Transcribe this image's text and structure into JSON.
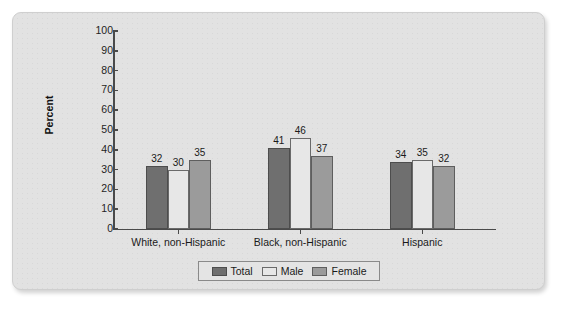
{
  "chart_data": {
    "type": "bar",
    "title": "",
    "subtitle": "",
    "xlabel": "",
    "ylabel": "Percent",
    "categories": [
      "White, non-Hispanic",
      "Black, non-Hispanic",
      "Hispanic"
    ],
    "series": [
      {
        "name": "Total",
        "values": [
          32,
          41,
          34
        ],
        "color": "#6f6f6f"
      },
      {
        "name": "Male",
        "values": [
          30,
          46,
          35
        ],
        "color": "#e7e7e7"
      },
      {
        "name": "Female",
        "values": [
          35,
          37,
          32
        ],
        "color": "#9b9b9b"
      }
    ],
    "ylim": [
      0,
      100
    ],
    "yticks": [
      100,
      90,
      80,
      70,
      60,
      50,
      40,
      30,
      20,
      10,
      0
    ],
    "ytick_labels": [
      "100",
      "90",
      "80",
      "70",
      "60",
      "50",
      "40",
      "30",
      "20",
      "10",
      "0"
    ],
    "grid": false,
    "data_labels": true,
    "legend_position": "bottom-center",
    "legend_entries": [
      "Total",
      "Male",
      "Female"
    ],
    "axis_color": "#4a4a4a",
    "background_color": "#e2e2e2"
  }
}
